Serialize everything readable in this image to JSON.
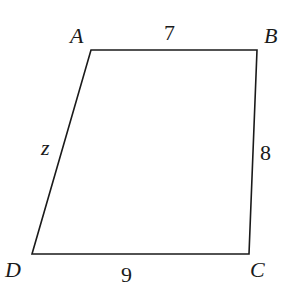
{
  "diagram": {
    "type": "quadrilateral",
    "vertices": [
      {
        "name": "A",
        "x": 91,
        "y": 50,
        "label_x": 70,
        "label_y": 43
      },
      {
        "name": "B",
        "x": 257,
        "y": 50,
        "label_x": 264,
        "label_y": 43
      },
      {
        "name": "C",
        "x": 249,
        "y": 254,
        "label_x": 250,
        "label_y": 277
      },
      {
        "name": "D",
        "x": 32,
        "y": 254,
        "label_x": 5,
        "label_y": 277
      }
    ],
    "sides": [
      {
        "from": "A",
        "to": "B",
        "label": "7",
        "label_x": 164,
        "label_y": 40,
        "italic": false
      },
      {
        "from": "B",
        "to": "C",
        "label": "8",
        "label_x": 260,
        "label_y": 160,
        "italic": false
      },
      {
        "from": "C",
        "to": "D",
        "label": "9",
        "label_x": 121,
        "label_y": 282,
        "italic": false
      },
      {
        "from": "D",
        "to": "A",
        "label": "z",
        "label_x": 41,
        "label_y": 155,
        "italic": true
      }
    ],
    "stroke_color": "#1a1a1a"
  }
}
